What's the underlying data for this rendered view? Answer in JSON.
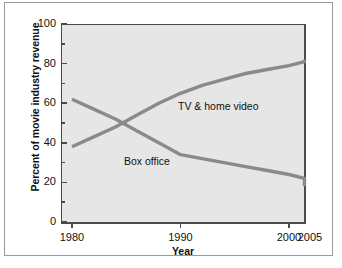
{
  "chart_data": {
    "type": "line",
    "title": "",
    "xlabel": "Year",
    "ylabel": "Percent of movie industry revenue",
    "xlim": [
      1980,
      2005
    ],
    "ylim": [
      0,
      100
    ],
    "grid": false,
    "legend_position": "inline-annotations",
    "y_ticks": [
      0,
      20,
      40,
      60,
      80,
      100
    ],
    "y_tick_labels": [
      "0",
      "20",
      "40",
      "60",
      "80",
      "100"
    ],
    "y_minor_ticks": [
      10,
      30,
      50,
      70,
      90
    ],
    "x_ticks": [
      1980,
      1990,
      2000
    ],
    "x_tick_labels": [
      "1980",
      "1990",
      "2000"
    ],
    "x_extra_labels": [
      {
        "label": "2005",
        "value": 2005
      }
    ],
    "line_color": "#8a8a8a",
    "plot_background": "#e6e6e6",
    "axis_color": "#4a4a4a",
    "series": [
      {
        "name": "TV & home video",
        "label": "TV & home video",
        "x": [
          1980,
          1982,
          1984,
          1986,
          1988,
          1990,
          1992,
          1994,
          1996,
          1998,
          2000,
          2002,
          2003.5
        ],
        "values": [
          38,
          43,
          48,
          54,
          60,
          65,
          69,
          72,
          75,
          77,
          79,
          81,
          82
        ]
      },
      {
        "name": "Box office",
        "label": "Box office",
        "x": [
          1980,
          1982,
          1984,
          1986,
          1988,
          1990,
          1992,
          1994,
          1996,
          1998,
          2000,
          2002,
          2003.5
        ],
        "values": [
          62,
          57,
          52,
          46,
          40,
          34,
          32,
          30,
          28,
          26,
          24,
          22,
          18
        ]
      }
    ]
  },
  "axis": {
    "y_title": "Percent of movie industry revenue",
    "x_title": "Year"
  }
}
